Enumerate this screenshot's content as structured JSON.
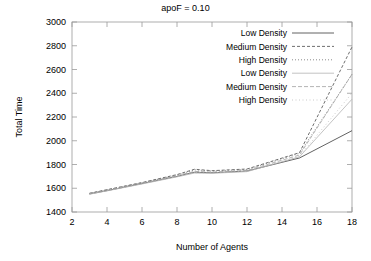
{
  "chart_data": {
    "type": "line",
    "title": "apoF = 0.10",
    "xlabel": "Number of Agents",
    "ylabel": "Total Time",
    "xlim": [
      2,
      18
    ],
    "ylim": [
      1400,
      3000
    ],
    "xticks": [
      2,
      4,
      6,
      8,
      10,
      12,
      14,
      16,
      18
    ],
    "xtick_labels": [
      "2",
      "4",
      "6",
      "8",
      "10",
      "12",
      "14",
      "16",
      "18"
    ],
    "yticks": [
      1400,
      1600,
      1800,
      2000,
      2200,
      2400,
      2600,
      2800,
      3000
    ],
    "ytick_labels": [
      "1400",
      "1600",
      "1800",
      "2000",
      "2200",
      "2400",
      "2600",
      "2800",
      "3000"
    ],
    "grid": false,
    "legend_position": "top-right",
    "x": [
      3,
      4,
      6,
      8,
      9,
      10,
      12,
      15,
      18
    ],
    "series": [
      {
        "name": "Low Density",
        "label": "Low Density",
        "style": "solid",
        "color": "#3a3a3a",
        "dash": "none",
        "values": [
          1552,
          1580,
          1640,
          1700,
          1735,
          1730,
          1745,
          1855,
          2085
        ]
      },
      {
        "name": "Medium Density",
        "label": "Medium Density",
        "style": "dashed",
        "color": "#4a4a4a",
        "dash": "3,2",
        "values": [
          1558,
          1588,
          1648,
          1715,
          1760,
          1748,
          1762,
          1900,
          2790
        ]
      },
      {
        "name": "High Density",
        "label": "High Density",
        "style": "dotted",
        "color": "#6e6e6e",
        "dash": "1,2",
        "values": [
          1556,
          1586,
          1646,
          1712,
          1755,
          1745,
          1758,
          1895,
          2560
        ]
      },
      {
        "name": "Low Density 2",
        "label": "Low Density",
        "style": "solid-light",
        "color": "#b4b4b4",
        "dash": "none",
        "values": [
          1550,
          1578,
          1636,
          1696,
          1728,
          1726,
          1740,
          1865,
          2350
        ]
      },
      {
        "name": "Medium Density 2",
        "label": "Medium Density",
        "style": "dashed-light",
        "color": "#a0a0a0",
        "dash": "4,2",
        "values": [
          1554,
          1582,
          1642,
          1706,
          1742,
          1736,
          1750,
          1880,
          2560
        ]
      },
      {
        "name": "High Density 2",
        "label": "High Density",
        "style": "dotted-light",
        "color": "#bcbcbc",
        "dash": "1,2.5",
        "values": [
          1551,
          1579,
          1638,
          1699,
          1731,
          1728,
          1743,
          1870,
          2400
        ]
      }
    ]
  },
  "legend": {
    "entries": [
      {
        "label": "Low Density"
      },
      {
        "label": "Medium Density"
      },
      {
        "label": "High Density"
      },
      {
        "label": "Low Density"
      },
      {
        "label": "Medium Density"
      },
      {
        "label": "High Density"
      }
    ]
  }
}
